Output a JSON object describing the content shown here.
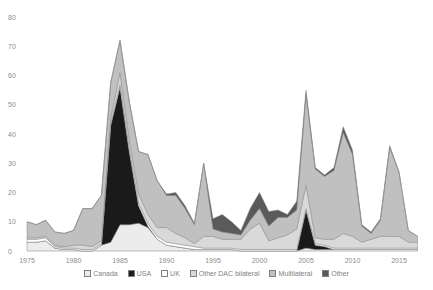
{
  "chart_data": {
    "type": "area",
    "stacked": true,
    "title": "",
    "xlabel": "",
    "ylabel": "",
    "ylim": [
      0,
      80
    ],
    "yticks": [
      0,
      10,
      20,
      30,
      40,
      50,
      60,
      70,
      80
    ],
    "xticks": [
      1975,
      1980,
      1985,
      1990,
      1995,
      2000,
      2005,
      2010,
      2015
    ],
    "grid": false,
    "legend_position": "bottom",
    "x": [
      1975,
      1976,
      1977,
      1978,
      1979,
      1980,
      1981,
      1982,
      1983,
      1984,
      1985,
      1986,
      1987,
      1988,
      1989,
      1990,
      1991,
      1992,
      1993,
      1994,
      1995,
      1996,
      1997,
      1998,
      1999,
      2000,
      2001,
      2002,
      2003,
      2004,
      2005,
      2006,
      2007,
      2008,
      2009,
      2010,
      2011,
      2012,
      2013,
      2014,
      2015,
      2016,
      2017
    ],
    "series": [
      {
        "name": "Canada",
        "color": "#ececec",
        "values": [
          3,
          3,
          3.5,
          1,
          0.5,
          0.5,
          0,
          0,
          2,
          3,
          9,
          9,
          9.5,
          8,
          4,
          2,
          1.5,
          1,
          0.5,
          0.5,
          0.5,
          0.5,
          0.5,
          0,
          0,
          0,
          0,
          0,
          0,
          0,
          1,
          0.5,
          0.5,
          0.5,
          0.5,
          0.5,
          0.5,
          0.5,
          0.5,
          0.5,
          0.5,
          0.5,
          0.5
        ]
      },
      {
        "name": "USA",
        "color": "#1a1a1a",
        "values": [
          0,
          0,
          0,
          0,
          0,
          0,
          0,
          0,
          0,
          40,
          47,
          25,
          6,
          0.5,
          0,
          0,
          0,
          0,
          0,
          0,
          0,
          0,
          0,
          0,
          0,
          0,
          0,
          0,
          0,
          0,
          13,
          1.5,
          1,
          0,
          0,
          0,
          0,
          0,
          0,
          0,
          0,
          0,
          0
        ]
      },
      {
        "name": "UK",
        "color": "#ffffff",
        "values": [
          1,
          1,
          1,
          0.5,
          0.5,
          0.5,
          0.5,
          0.5,
          0.5,
          0.5,
          1,
          1,
          1,
          1,
          1,
          1,
          1,
          1,
          1,
          0.5,
          0.5,
          0.5,
          0.5,
          0.5,
          0.5,
          0.5,
          0.5,
          0.5,
          0.5,
          0.5,
          0.5,
          0.5,
          0.5,
          0.5,
          0.5,
          0.5,
          0.5,
          0.5,
          0.5,
          0.5,
          0.5,
          0.5,
          0.5
        ]
      },
      {
        "name": "Other DAC bilateral",
        "color": "#d9d9d9",
        "values": [
          0.5,
          0.5,
          0.5,
          0.5,
          0.5,
          1,
          1.5,
          1,
          1,
          2,
          4,
          3,
          3,
          3,
          3,
          5,
          3.5,
          2.5,
          1,
          4,
          4,
          3,
          3,
          3.5,
          7,
          9,
          3,
          4,
          5,
          7,
          8,
          2,
          2,
          3,
          5,
          4,
          2,
          3,
          4,
          4,
          4,
          2,
          2
        ]
      },
      {
        "name": "Multilateral",
        "color": "#c0c0c0",
        "values": [
          5.5,
          4.5,
          5.5,
          4.5,
          4.5,
          5,
          12.5,
          13,
          15.5,
          12,
          11,
          13,
          14.5,
          20.5,
          16,
          11,
          13,
          10,
          6.5,
          25,
          2.5,
          2.5,
          2,
          1.5,
          3,
          5,
          5,
          7,
          6,
          6.5,
          31,
          23.5,
          21.5,
          23.5,
          34.5,
          28,
          5.5,
          2,
          5.5,
          30.5,
          22,
          4,
          2
        ]
      },
      {
        "name": "Other",
        "color": "#5a5a5a",
        "values": [
          0,
          0,
          0,
          0,
          0,
          0,
          0,
          0,
          0,
          0,
          0,
          0,
          0,
          0,
          0,
          0.5,
          1,
          1,
          0.5,
          0,
          3.5,
          6,
          4,
          1.5,
          4,
          5.5,
          5,
          2.5,
          1,
          3,
          1.5,
          0.5,
          0.5,
          1,
          2,
          1.5,
          0.5,
          0.5,
          0.5,
          0.5,
          0,
          0,
          0
        ]
      }
    ]
  },
  "legend": {
    "items": [
      {
        "label": "Canada"
      },
      {
        "label": "USA"
      },
      {
        "label": "UK"
      },
      {
        "label": "Other DAC bilateral"
      },
      {
        "label": "Multilateral"
      },
      {
        "label": "Other"
      }
    ]
  }
}
